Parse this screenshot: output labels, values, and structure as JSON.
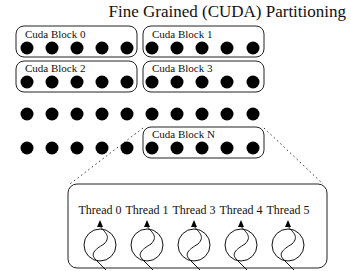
{
  "title": "Fine Grained (CUDA) Partitioning",
  "blocks": [
    {
      "label": "Cuda Block 0"
    },
    {
      "label": "Cuda Block 1"
    },
    {
      "label": "Cuda Block 2"
    },
    {
      "label": "Cuda Block 3"
    },
    {
      "label": "Cuda Block N"
    }
  ],
  "threads": [
    {
      "label": "Thread 0"
    },
    {
      "label": "Thread 1"
    },
    {
      "label": "Thread 3"
    },
    {
      "label": "Thread 4"
    },
    {
      "label": "Thread 5"
    }
  ],
  "colors": {
    "ink": "#000000",
    "background": "#ffffff"
  }
}
